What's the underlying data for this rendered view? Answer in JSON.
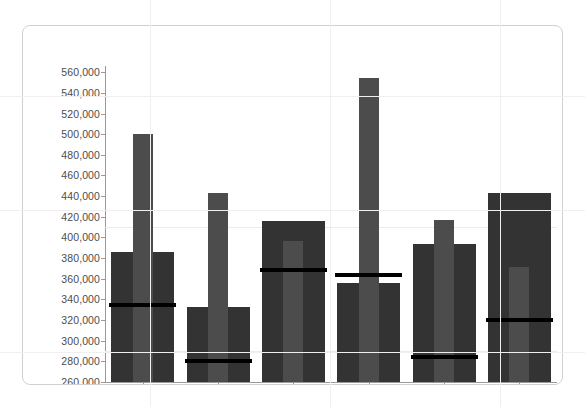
{
  "chart_data": {
    "type": "bar",
    "title": "",
    "subtitle": "",
    "xlabel": "",
    "ylabel": "",
    "categories": [
      "Abel",
      "Blanchet",
      "Charron",
      "Denis",
      "Leblanc",
      "Reyer"
    ],
    "ylim": [
      260000,
      566000
    ],
    "yticks": [
      260000,
      280000,
      300000,
      320000,
      340000,
      360000,
      380000,
      400000,
      420000,
      440000,
      460000,
      480000,
      500000,
      520000,
      540000,
      560000
    ],
    "ytick_labels": [
      "260,000",
      "280,000",
      "300,000",
      "320,000",
      "340,000",
      "360,000",
      "380,000",
      "400,000",
      "420,000",
      "440,000",
      "460,000",
      "480,000",
      "500,000",
      "520,000",
      "540,000",
      "560,000"
    ],
    "grid": true,
    "legend": "none",
    "series": [
      {
        "name": "outer-bar",
        "role": "range",
        "color": "#333334",
        "values": [
          386000,
          333000,
          416000,
          356000,
          394000,
          443000
        ]
      },
      {
        "name": "inner-bar",
        "role": "measure",
        "color": "#4c4c4d",
        "values": [
          500000,
          443000,
          397000,
          554000,
          417000,
          371000
        ]
      },
      {
        "name": "target-line",
        "role": "target",
        "color": "#000000",
        "values": [
          335000,
          280000,
          368000,
          364000,
          284000,
          320000
        ]
      }
    ]
  },
  "card": {
    "border_color": "#d0d0d0",
    "background": "#ffffff"
  }
}
